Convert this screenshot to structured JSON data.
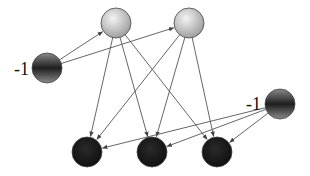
{
  "diagram": {
    "type": "neural-network",
    "colors": {
      "edge": "#555555",
      "hidden_fill_light": "#f4f4f4",
      "hidden_fill_dark": "#9a9a9a",
      "bias_fill_light": "#8a8a8a",
      "bias_fill_dark": "#1e1e1e",
      "output_fill": "#141414",
      "node_stroke": "#444444"
    },
    "node_radius": 15,
    "nodes": [
      {
        "id": "hidden-1",
        "role": "hidden",
        "x": 116,
        "y": 23
      },
      {
        "id": "hidden-2",
        "role": "hidden",
        "x": 189,
        "y": 23
      },
      {
        "id": "bias-input",
        "role": "bias",
        "x": 47,
        "y": 68,
        "label": "-1"
      },
      {
        "id": "bias-output",
        "role": "bias",
        "x": 280,
        "y": 104,
        "label": "-1"
      },
      {
        "id": "output-1",
        "role": "output",
        "x": 87,
        "y": 152
      },
      {
        "id": "output-2",
        "role": "output",
        "x": 152,
        "y": 152
      },
      {
        "id": "output-3",
        "role": "output",
        "x": 217,
        "y": 152
      }
    ],
    "edges": [
      {
        "from": "bias-input",
        "to": "hidden-1"
      },
      {
        "from": "bias-input",
        "to": "hidden-2"
      },
      {
        "from": "hidden-1",
        "to": "output-1"
      },
      {
        "from": "hidden-1",
        "to": "output-2"
      },
      {
        "from": "hidden-1",
        "to": "output-3"
      },
      {
        "from": "hidden-2",
        "to": "output-1"
      },
      {
        "from": "hidden-2",
        "to": "output-2"
      },
      {
        "from": "hidden-2",
        "to": "output-3"
      },
      {
        "from": "bias-output",
        "to": "output-1"
      },
      {
        "from": "bias-output",
        "to": "output-2"
      },
      {
        "from": "bias-output",
        "to": "output-3"
      }
    ],
    "labels": {
      "bias_input": "-1",
      "bias_output": "-1"
    }
  }
}
